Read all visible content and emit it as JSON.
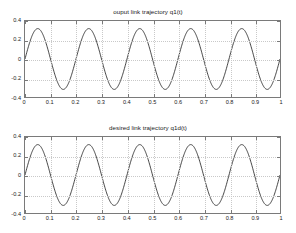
{
  "figure": {
    "background": "#ffffff",
    "axis_color": "#7a7a7a",
    "grid_color": "#c9c9c9",
    "line_color": "#262626"
  },
  "panels": [
    {
      "id": "output-link-trajectory",
      "title": "ouput link trajectory q1(t)"
    },
    {
      "id": "desired-link-trajectory",
      "title": "desired link trajectory q1d(t)"
    }
  ],
  "axis": {
    "xticklabels": [
      "0",
      "0.1",
      "0.2",
      "0.3",
      "0.4",
      "0.5",
      "0.6",
      "0.7",
      "0.8",
      "0.9",
      "1"
    ],
    "yticklabels": [
      "0.4",
      "0.2",
      "0",
      "-0.2",
      "-0.4"
    ],
    "xticks": [
      0,
      0.1,
      0.2,
      0.3,
      0.4,
      0.5,
      0.6,
      0.7,
      0.8,
      0.9,
      1
    ],
    "yticks": [
      0.4,
      0.2,
      0,
      -0.2,
      -0.4
    ]
  },
  "chart_data": [
    {
      "type": "line",
      "title": "ouput link trajectory q1(t)",
      "xlabel": "",
      "ylabel": "",
      "xlim": [
        0,
        1
      ],
      "ylim": [
        -0.4,
        0.4
      ],
      "grid": true,
      "legend": null,
      "xticks": [
        0,
        0.1,
        0.2,
        0.3,
        0.4,
        0.5,
        0.6,
        0.7,
        0.8,
        0.9,
        1
      ],
      "yticks": [
        0.4,
        0.2,
        0,
        -0.2,
        -0.4
      ],
      "series": [
        {
          "name": "q1(t)",
          "color": "#262626",
          "form": "amplitude * sin(2*pi*t/period)",
          "amplitude": 0.32,
          "period": 0.2,
          "phase": 0,
          "x": [
            0,
            0.025,
            0.05,
            0.075,
            0.1,
            0.125,
            0.15,
            0.175,
            0.2,
            0.225,
            0.25,
            0.275,
            0.3,
            0.325,
            0.35,
            0.375,
            0.4,
            0.425,
            0.45,
            0.475,
            0.5,
            0.525,
            0.55,
            0.575,
            0.6,
            0.625,
            0.65,
            0.675,
            0.7,
            0.725,
            0.75,
            0.775,
            0.8,
            0.825,
            0.85,
            0.875,
            0.9,
            0.925,
            0.95,
            0.975,
            1
          ],
          "values": [
            0,
            0.226,
            0.32,
            0.226,
            0,
            -0.226,
            -0.32,
            -0.226,
            0,
            0.226,
            0.32,
            0.226,
            0,
            -0.226,
            -0.32,
            -0.226,
            0,
            0.226,
            0.32,
            0.226,
            0,
            -0.226,
            -0.32,
            -0.226,
            0,
            0.226,
            0.32,
            0.226,
            0,
            -0.226,
            -0.32,
            -0.226,
            0,
            0.226,
            0.32,
            0.226,
            0,
            -0.226,
            -0.32,
            -0.226,
            0
          ]
        }
      ]
    },
    {
      "type": "line",
      "title": "desired link trajectory q1d(t)",
      "xlabel": "",
      "ylabel": "",
      "xlim": [
        0,
        1
      ],
      "ylim": [
        -0.4,
        0.4
      ],
      "grid": true,
      "legend": null,
      "xticks": [
        0,
        0.1,
        0.2,
        0.3,
        0.4,
        0.5,
        0.6,
        0.7,
        0.8,
        0.9,
        1
      ],
      "yticks": [
        0.4,
        0.2,
        0,
        -0.2,
        -0.4
      ],
      "series": [
        {
          "name": "q1d(t)",
          "color": "#262626",
          "form": "amplitude * sin(2*pi*t/period)",
          "amplitude": 0.32,
          "period": 0.2,
          "phase": 0,
          "x": [
            0,
            0.025,
            0.05,
            0.075,
            0.1,
            0.125,
            0.15,
            0.175,
            0.2,
            0.225,
            0.25,
            0.275,
            0.3,
            0.325,
            0.35,
            0.375,
            0.4,
            0.425,
            0.45,
            0.475,
            0.5,
            0.525,
            0.55,
            0.575,
            0.6,
            0.625,
            0.65,
            0.675,
            0.7,
            0.725,
            0.75,
            0.775,
            0.8,
            0.825,
            0.85,
            0.875,
            0.9,
            0.925,
            0.95,
            0.975,
            1
          ],
          "values": [
            0,
            0.226,
            0.32,
            0.226,
            0,
            -0.226,
            -0.32,
            -0.226,
            0,
            0.226,
            0.32,
            0.226,
            0,
            -0.226,
            -0.32,
            -0.226,
            0,
            0.226,
            0.32,
            0.226,
            0,
            -0.226,
            -0.32,
            -0.226,
            0,
            0.226,
            0.32,
            0.226,
            0,
            -0.226,
            -0.32,
            -0.226,
            0,
            0.226,
            0.32,
            0.226,
            0,
            -0.226,
            -0.32,
            -0.226,
            0
          ]
        }
      ]
    }
  ]
}
